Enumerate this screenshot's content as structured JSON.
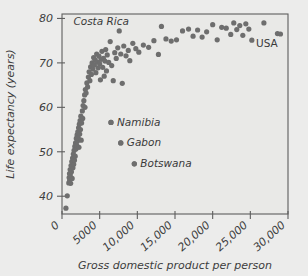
{
  "chart_data": {
    "type": "scatter",
    "title": "",
    "xlabel": "Gross domestic product per person",
    "ylabel": "Life expectancy (years)",
    "xlim": [
      0,
      30000
    ],
    "ylim": [
      36,
      81
    ],
    "grid": false,
    "legend": "none",
    "xticks": [
      0,
      5000,
      10000,
      15000,
      20000,
      25000,
      30000
    ],
    "xticklabels": [
      "0",
      "5000",
      "10,000",
      "15,000",
      "20,000",
      "25,000",
      "30,000"
    ],
    "yticks": [
      40,
      50,
      60,
      70,
      80
    ],
    "yticklabels": [
      "40",
      "50",
      "60",
      "70",
      "80"
    ],
    "marker_color": "#6e6e6e",
    "plot_background": "#e9e9e7",
    "axis_color": "#5e5e5e",
    "annotations": [
      {
        "text": "Costa Rica",
        "x": 5200,
        "y": 79.4,
        "style": "italic",
        "marker": false
      },
      {
        "text": "USA",
        "x": 27200,
        "y": 74.3,
        "style": "plain",
        "marker": false
      },
      {
        "text": "Namibia",
        "x": 6500,
        "y": 56.6,
        "style": "italic",
        "marker": true
      },
      {
        "text": "Gabon",
        "x": 7800,
        "y": 52.0,
        "style": "italic",
        "marker": true
      },
      {
        "text": "Botswana",
        "x": 9600,
        "y": 47.3,
        "style": "italic",
        "marker": true
      }
    ],
    "points": [
      [
        520,
        37.3
      ],
      [
        700,
        40.1
      ],
      [
        900,
        43.0
      ],
      [
        950,
        44.2
      ],
      [
        1000,
        45.1
      ],
      [
        1020,
        43.6
      ],
      [
        1080,
        46.0
      ],
      [
        1100,
        44.8
      ],
      [
        1150,
        42.9
      ],
      [
        1200,
        46.9
      ],
      [
        1250,
        45.5
      ],
      [
        1300,
        47.8
      ],
      [
        1350,
        44.0
      ],
      [
        1400,
        48.6
      ],
      [
        1450,
        46.4
      ],
      [
        1500,
        49.5
      ],
      [
        1550,
        47.2
      ],
      [
        1600,
        50.3
      ],
      [
        1650,
        48.1
      ],
      [
        1700,
        51.2
      ],
      [
        1750,
        49.0
      ],
      [
        1800,
        52.0
      ],
      [
        1850,
        50.6
      ],
      [
        1900,
        53.0
      ],
      [
        1950,
        51.5
      ],
      [
        2000,
        53.8
      ],
      [
        2050,
        52.4
      ],
      [
        2100,
        54.5
      ],
      [
        2150,
        53.2
      ],
      [
        2200,
        55.4
      ],
      [
        2250,
        51.0
      ],
      [
        2300,
        56.2
      ],
      [
        2350,
        54.0
      ],
      [
        2400,
        57.0
      ],
      [
        2450,
        55.0
      ],
      [
        2500,
        58.0
      ],
      [
        2550,
        52.6
      ],
      [
        2600,
        56.5
      ],
      [
        2700,
        59.2
      ],
      [
        2750,
        57.5
      ],
      [
        2800,
        60.4
      ],
      [
        2900,
        61.5
      ],
      [
        3000,
        62.8
      ],
      [
        3050,
        60.0
      ],
      [
        3100,
        64.0
      ],
      [
        3200,
        63.2
      ],
      [
        3300,
        65.5
      ],
      [
        3400,
        64.6
      ],
      [
        3500,
        66.8
      ],
      [
        3600,
        68.0
      ],
      [
        3700,
        66.0
      ],
      [
        3800,
        69.1
      ],
      [
        3900,
        67.4
      ],
      [
        4000,
        70.0
      ],
      [
        4100,
        68.6
      ],
      [
        4200,
        71.2
      ],
      [
        4300,
        69.5
      ],
      [
        4400,
        70.6
      ],
      [
        4500,
        67.8
      ],
      [
        4600,
        72.0
      ],
      [
        4700,
        70.2
      ],
      [
        4800,
        68.9
      ],
      [
        4900,
        71.5
      ],
      [
        5000,
        69.8
      ],
      [
        5100,
        66.2
      ],
      [
        5200,
        70.8
      ],
      [
        5300,
        72.6
      ],
      [
        5400,
        69.0
      ],
      [
        5500,
        71.0
      ],
      [
        5600,
        67.0
      ],
      [
        5700,
        70.4
      ],
      [
        5800,
        73.0
      ],
      [
        5900,
        68.2
      ],
      [
        6000,
        71.8
      ],
      [
        6200,
        70.1
      ],
      [
        6400,
        74.8
      ],
      [
        6600,
        69.4
      ],
      [
        6800,
        66.0
      ],
      [
        7000,
        72.3
      ],
      [
        7200,
        71.0
      ],
      [
        7400,
        73.4
      ],
      [
        7600,
        77.2
      ],
      [
        7800,
        72.0
      ],
      [
        8000,
        65.4
      ],
      [
        8200,
        73.8
      ],
      [
        8500,
        71.6
      ],
      [
        8800,
        72.8
      ],
      [
        9000,
        70.5
      ],
      [
        9400,
        74.4
      ],
      [
        9800,
        73.2
      ],
      [
        10200,
        72.4
      ],
      [
        10800,
        74.0
      ],
      [
        11500,
        73.5
      ],
      [
        12200,
        75.0
      ],
      [
        12800,
        71.9
      ],
      [
        13200,
        78.2
      ],
      [
        13800,
        75.4
      ],
      [
        14500,
        74.9
      ],
      [
        15200,
        75.2
      ],
      [
        16000,
        77.2
      ],
      [
        16800,
        77.6
      ],
      [
        17400,
        76.0
      ],
      [
        18000,
        77.4
      ],
      [
        18600,
        75.8
      ],
      [
        19200,
        77.0
      ],
      [
        20000,
        78.6
      ],
      [
        20600,
        75.2
      ],
      [
        21200,
        78.0
      ],
      [
        21800,
        77.8
      ],
      [
        22400,
        76.4
      ],
      [
        22800,
        79.0
      ],
      [
        23200,
        77.5
      ],
      [
        23600,
        78.4
      ],
      [
        24000,
        76.2
      ],
      [
        24400,
        78.8
      ],
      [
        24800,
        77.6
      ],
      [
        25200,
        75.1
      ],
      [
        26800,
        79.0
      ],
      [
        28600,
        76.6
      ],
      [
        29000,
        76.5
      ],
      [
        6500,
        56.6
      ],
      [
        7800,
        52.0
      ],
      [
        9600,
        47.3
      ]
    ]
  }
}
